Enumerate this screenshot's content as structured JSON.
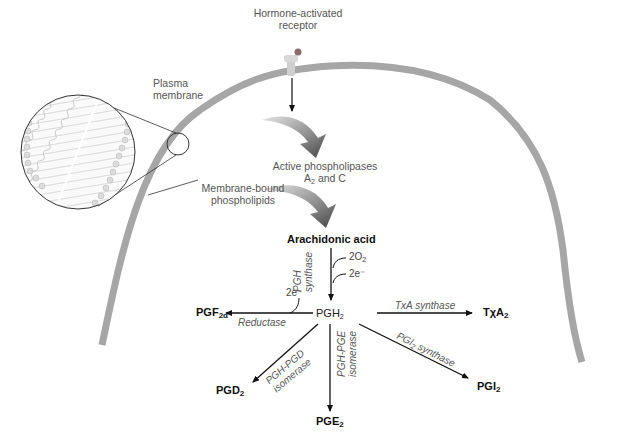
{
  "labels": {
    "receptor_line1": "Hormone-activated",
    "receptor_line2": "receptor",
    "plasma_line1": "Plasma",
    "plasma_line2": "membrane",
    "phospholipases_line1": "Active phospholipases",
    "phospholipases_A": "A",
    "phospholipases_A_sub": "2",
    "phospholipases_rest": " and C",
    "membrane_bound_line1": "Membrane-bound",
    "membrane_bound_line2": "phospholipids",
    "arachidonic": "Arachidonic acid",
    "pgh2": "PGH",
    "pgh2_sub": "2"
  },
  "cofactors": {
    "o2": "2O",
    "o2_sub": "2",
    "e1": "2e⁻",
    "e2": "2e⁻"
  },
  "enzymes": {
    "pgh_synthase_line1": "PGH",
    "pgh_synthase_line2": "synthase",
    "reductase": "Reductase",
    "txa_synthase": "TxA synthase",
    "pgi2_synthase_a": "PGI",
    "pgi2_synthase_sub": "2",
    "pgi2_synthase_b": " synthase",
    "pgh_pgd_line1": "PGH-PGD",
    "pgh_pgd_line2": "isomerase",
    "pgh_pge_line1": "PGH-PGE",
    "pgh_pge_line2": "isomerase"
  },
  "products": {
    "pgf": "PGF",
    "pgf_sub": "2α",
    "pgd": "PGD",
    "pgd_sub": "2",
    "pge": "PGE",
    "pge_sub": "2",
    "pgi": "PGI",
    "pgi_sub": "2",
    "txa": "TχA",
    "txa_sub": "2"
  },
  "colors": {
    "membrane": "#a6a6a6",
    "curved_arrow_dark": "#555555",
    "curved_arrow_light": "#e0e0e0",
    "arrow": "#111111"
  }
}
